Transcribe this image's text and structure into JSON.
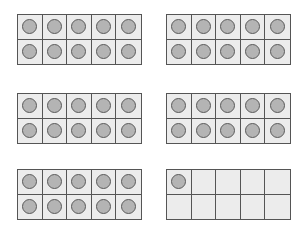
{
  "colors": {
    "cell_fill": "#ececec",
    "grid_line": "#555555",
    "counter_fill": "#b4b4b4",
    "counter_stroke": "#5a5a5a"
  },
  "frames": [
    {
      "filled": 10
    },
    {
      "filled": 10
    },
    {
      "filled": 10
    },
    {
      "filled": 10
    },
    {
      "filled": 10
    },
    {
      "filled": 1
    }
  ]
}
